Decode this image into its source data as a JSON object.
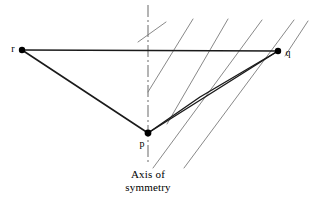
{
  "figure": {
    "type": "geometry-diagram",
    "background_color": "#ffffff",
    "width": 324,
    "height": 207,
    "caption": {
      "line1": "Axis of",
      "line2": "symmetry",
      "color": "#000000"
    },
    "points": [
      {
        "id": "r",
        "label": "r",
        "x": 22,
        "y": 50,
        "label_x": 13,
        "label_y": 50,
        "radius": 3.2,
        "color": "#000000"
      },
      {
        "id": "q",
        "label": "q",
        "x": 278,
        "y": 51,
        "label_x": 287,
        "label_y": 54,
        "radius": 3.2,
        "color": "#000000"
      },
      {
        "id": "p",
        "label": "p",
        "x": 148,
        "y": 133,
        "label_x": 141,
        "label_y": 145,
        "radius": 3.4,
        "color": "#000000"
      }
    ],
    "solid_segments": [
      {
        "name": "segment-r-q",
        "from": [
          22,
          50
        ],
        "to": [
          278,
          51
        ],
        "width": 1.5,
        "color": "#1a1a1a"
      },
      {
        "name": "segment-r-p",
        "from": [
          22,
          50
        ],
        "to": [
          148,
          133
        ],
        "width": 1.6,
        "color": "#1a1a1a"
      },
      {
        "name": "segment-p-q-direct",
        "from": [
          148,
          133
        ],
        "to": [
          278,
          51
        ],
        "width": 1.4,
        "color": "#1a1a1a"
      }
    ],
    "bent_path": {
      "name": "bent-path-p-bend-q",
      "vertices": [
        [
          148,
          133
        ],
        [
          200,
          97
        ],
        [
          278,
          51
        ]
      ],
      "width": 1.4,
      "color": "#1a1a1a"
    },
    "symmetry_axis": {
      "name": "symmetry-axis-line",
      "x": 148,
      "y_top": 5,
      "y_bottom": 164,
      "color": "#777777",
      "width": 1.1,
      "dash": "12,3,2,3"
    },
    "hatch_lines": {
      "color": "#7b7b7b",
      "width": 0.9,
      "slope_note": "positive slope, parallel family rising to the right",
      "segments": [
        {
          "from": [
            138,
            42
          ],
          "to": [
            166,
            22
          ]
        },
        {
          "from": [
            148,
            92
          ],
          "to": [
            193,
            19
          ]
        },
        {
          "from": [
            167,
            124
          ],
          "to": [
            228,
            19
          ]
        },
        {
          "from": [
            153,
            168
          ],
          "to": [
            262,
            20
          ]
        },
        {
          "from": [
            184,
            168
          ],
          "to": [
            294,
            20
          ]
        },
        {
          "from": [
            285,
            56
          ],
          "to": [
            308,
            21
          ]
        }
      ]
    }
  }
}
